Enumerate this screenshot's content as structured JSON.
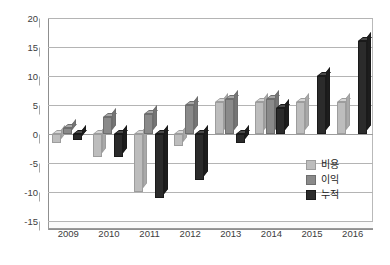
{
  "chart_data": {
    "type": "bar",
    "title": "",
    "subtitle": "",
    "xlabel": "",
    "ylabel": "",
    "categories": [
      "2009",
      "2010",
      "2011",
      "2012",
      "2013",
      "2014",
      "2015",
      "2016"
    ],
    "series": [
      {
        "name": "비용",
        "color": "#bdbdbd",
        "values": [
          -1.5,
          -4.0,
          -10.0,
          -2.0,
          5.5,
          5.5,
          5.5,
          5.5
        ]
      },
      {
        "name": "이익",
        "color": "#8a8a8a",
        "values": [
          1.0,
          3.0,
          3.5,
          5.0,
          6.0,
          6.0,
          0,
          0
        ]
      },
      {
        "name": "누적",
        "color": "#2b2b2b",
        "values": [
          -1.0,
          -4.0,
          -11.0,
          -8.0,
          -1.5,
          4.5,
          10.0,
          16.0
        ]
      }
    ],
    "ylim": [
      -15,
      20
    ],
    "yticks": [
      20,
      15,
      10,
      5,
      0,
      -5,
      -10,
      -15
    ],
    "ytick_labels": [
      "20",
      "15",
      "10",
      "5",
      "0",
      "-5",
      "-10",
      "-15"
    ],
    "grid": true,
    "legend_position": "inside-bottom-right",
    "style": "3d-column"
  },
  "legend": {
    "items": [
      {
        "label": "비용",
        "swatch": "sw-cost"
      },
      {
        "label": "이익",
        "swatch": "sw-profit"
      },
      {
        "label": "누적",
        "swatch": "sw-cum"
      }
    ]
  }
}
